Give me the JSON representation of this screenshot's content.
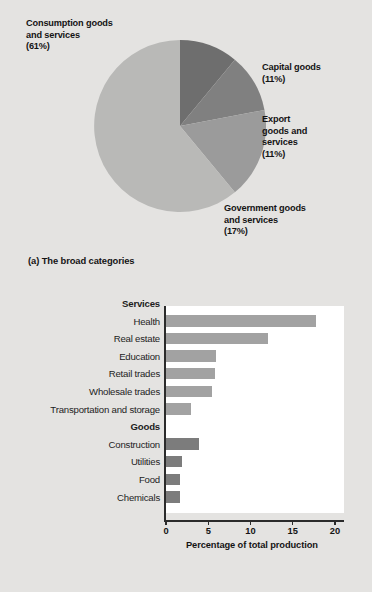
{
  "figure": {
    "panel_a_caption": "(a) The broad categories",
    "panel_b_caption": "(b) Some of the details"
  },
  "pie": {
    "labels": {
      "consumption": "Consumption goods\nand services\n(61%)",
      "consumption_l1": "Consumption goods",
      "consumption_l2": "and services",
      "consumption_l3": "(61%)",
      "capital_l1": "Capital goods",
      "capital_l2": "(11%)",
      "export_l1": "Export",
      "export_l2": "goods and",
      "export_l3": "services",
      "export_l4": "(11%)",
      "government_l1": "Government goods",
      "government_l2": "and services",
      "government_l3": "(17%)"
    }
  },
  "bar_axis": {
    "title": "Percentage of total production",
    "ticks": [
      "0",
      "5",
      "10",
      "15",
      "20"
    ],
    "group_services": "Services",
    "group_goods": "Goods"
  },
  "chart_data": [
    {
      "type": "pie",
      "title": "(a) The broad categories",
      "labels": [
        "Consumption goods and services",
        "Capital goods",
        "Export goods and services",
        "Government goods and services"
      ],
      "values": [
        61,
        11,
        11,
        17
      ],
      "value_unit": "percent",
      "colors": [
        "#b9b9b7",
        "#6e6e6e",
        "#808080",
        "#9b9b9b"
      ],
      "start_angle_deg": 0,
      "direction": "clockwise",
      "legend": "none (direct labels)"
    },
    {
      "type": "bar",
      "orientation": "horizontal",
      "title": "(b) Some of the details",
      "xlabel": "Percentage of total production",
      "ylabel": "",
      "xlim": [
        0,
        20
      ],
      "xticks": [
        0,
        5,
        10,
        15,
        20
      ],
      "grid": false,
      "legend": "none",
      "groups": [
        {
          "name": "Services",
          "color": "#a2a2a2",
          "categories": [
            "Health",
            "Real estate",
            "Education",
            "Retail trades",
            "Wholesale trades",
            "Transportation and storage"
          ],
          "values": [
            17.7,
            12.1,
            5.9,
            5.8,
            5.4,
            2.9
          ]
        },
        {
          "name": "Goods",
          "color": "#7c7c7c",
          "categories": [
            "Construction",
            "Utilities",
            "Food",
            "Chemicals"
          ],
          "values": [
            3.9,
            1.9,
            1.6,
            1.7
          ]
        }
      ]
    }
  ]
}
